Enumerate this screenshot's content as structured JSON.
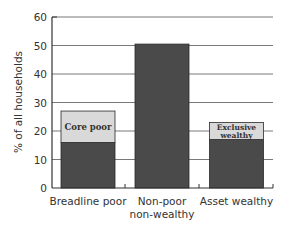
{
  "chart_data": {
    "type": "bar",
    "stacked": true,
    "title": "",
    "xlabel": "",
    "ylabel": "% of all households",
    "ylim": [
      0,
      60
    ],
    "yticks": [
      0,
      10,
      20,
      30,
      40,
      50,
      60
    ],
    "grid": true,
    "categories": [
      "Breadline poor",
      "Non-poor non-wealthy",
      "Asset wealthy"
    ],
    "category_labels": [
      [
        "Breadline poor"
      ],
      [
        "Non-poor",
        "non-wealthy"
      ],
      [
        "Asset wealthy"
      ]
    ],
    "series": [
      {
        "name": "Base",
        "color": "#4a4a4a",
        "values": [
          16,
          50.5,
          17
        ]
      },
      {
        "name": "Sub-group",
        "color": "#d9d9d9",
        "values": [
          11,
          0,
          6
        ],
        "labels": [
          [
            "Core poor"
          ],
          [],
          [
            "Exclusive",
            "wealthy"
          ]
        ]
      }
    ],
    "totals": [
      27,
      50.5,
      23
    ],
    "annotations": [
      {
        "category": "Breadline poor",
        "text": "Core poor"
      },
      {
        "category": "Asset wealthy",
        "text": "Exclusive wealthy"
      }
    ]
  },
  "colors": {
    "bar_dark": "#4a4a4a",
    "bar_light": "#d9d9d9",
    "axis": "#333333",
    "grid": "#555555"
  }
}
